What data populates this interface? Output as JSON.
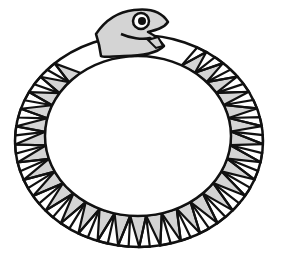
{
  "figure": {
    "width": 282,
    "height": 261,
    "colors": {
      "background": "#ffffff",
      "stroke": "#111111",
      "fill": "#d4d4d4",
      "eye_white": "#ffffff",
      "pupil": "#111111"
    },
    "body": {
      "outer": {
        "cx": 139,
        "cy": 141,
        "rx": 124,
        "ry": 106
      },
      "inner": {
        "cx": 138,
        "cy": 136,
        "rx": 93,
        "ry": 80
      },
      "segments": 30,
      "start_angle_deg": -62,
      "end_angle_deg": 232
    },
    "head": {
      "eye": {
        "cx": 141,
        "cy": 21,
        "r": 8,
        "pupil_r": 4
      }
    }
  }
}
